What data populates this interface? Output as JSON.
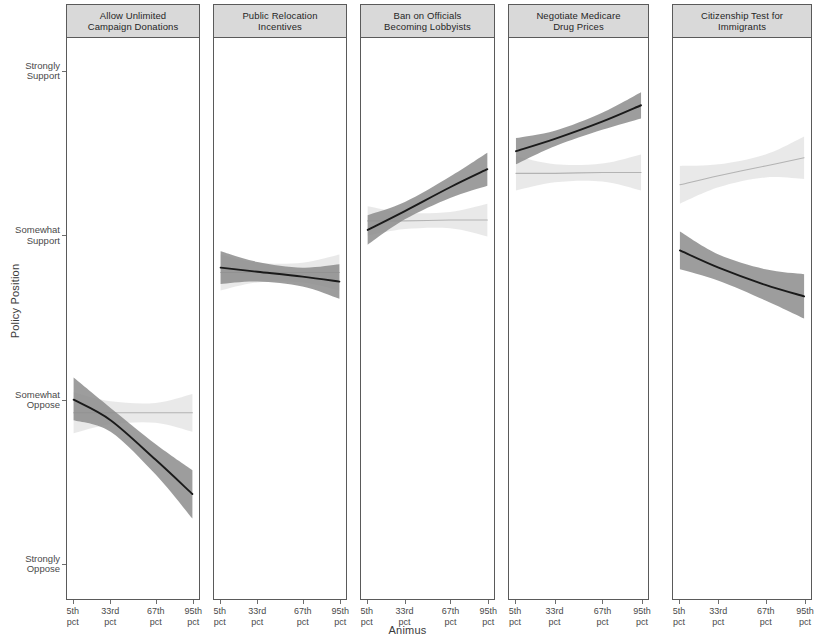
{
  "chart_data": {
    "type": "line",
    "title": "",
    "xlabel": "Animus",
    "ylabel": "Policy Position",
    "facet_titles": [
      "Allow Unlimited\nCampaign Donations",
      "Public Relocation\nIncentives",
      "Ban on Officials\nBecoming Lobbyists",
      "Negotiate Medicare\nDrug Prices",
      "Citizenship Test for\nImmigrants"
    ],
    "x_tick_labels": [
      "5th\npct",
      "33rd\npct",
      "67th\npct",
      "95th\npct"
    ],
    "x_tick_values": [
      5,
      33,
      67,
      95
    ],
    "y_tick_labels": [
      "Strongly\nSupport",
      "Somewhat\nSupport",
      "Somewhat\nOppose",
      "Strongly\nOppose"
    ],
    "y_tick_values": [
      4,
      3,
      2,
      1
    ],
    "ylim": [
      0.78,
      4.2
    ],
    "xlim": [
      0,
      100
    ],
    "grid": false,
    "legend": "none",
    "colors": {
      "series_dark_line": "#1a1a1a",
      "series_dark_band": "#8c8c8c",
      "series_light_line": "#b3b3b3",
      "series_light_band": "#e2e2e2",
      "panel_strip": "#d9d9d9",
      "panel_border": "#5a5a5a",
      "axis": "#6e6e6e"
    },
    "series": [
      {
        "name": "dark",
        "panels": [
          {
            "facet": "Allow Unlimited Campaign Donations",
            "x": [
              5,
              33,
              67,
              95
            ],
            "y": [
              1.995,
              1.87,
              1.63,
              1.42
            ],
            "ci_low": [
              1.87,
              1.8,
              1.54,
              1.27
            ],
            "ci_high": [
              2.13,
              1.945,
              1.725,
              1.565
            ]
          },
          {
            "facet": "Public Relocation Incentives",
            "x": [
              5,
              33,
              67,
              95
            ],
            "y": [
              2.8,
              2.775,
              2.745,
              2.715
            ],
            "ci_low": [
              2.7,
              2.715,
              2.685,
              2.61
            ],
            "ci_high": [
              2.9,
              2.835,
              2.8,
              2.82
            ]
          },
          {
            "facet": "Ban on Officials Becoming Lobbyists",
            "x": [
              5,
              33,
              67,
              95
            ],
            "y": [
              3.03,
              3.145,
              3.29,
              3.4
            ],
            "ci_low": [
              2.94,
              3.095,
              3.225,
              3.3
            ],
            "ci_high": [
              3.12,
              3.2,
              3.355,
              3.5
            ]
          },
          {
            "facet": "Negotiate Medicare Drug Prices",
            "x": [
              5,
              33,
              67,
              95
            ],
            "y": [
              3.51,
              3.585,
              3.69,
              3.79
            ],
            "ci_low": [
              3.43,
              3.54,
              3.64,
              3.71
            ],
            "ci_high": [
              3.59,
              3.635,
              3.745,
              3.87
            ]
          },
          {
            "facet": "Citizenship Test for Immigrants",
            "x": [
              5,
              33,
              67,
              95
            ],
            "y": [
              2.905,
              2.8,
              2.695,
              2.625
            ],
            "ci_low": [
              2.79,
              2.72,
              2.6,
              2.49
            ],
            "ci_high": [
              3.02,
              2.88,
              2.79,
              2.76
            ]
          }
        ]
      },
      {
        "name": "light",
        "panels": [
          {
            "facet": "Allow Unlimited Campaign Donations",
            "x": [
              5,
              33,
              67,
              95
            ],
            "y": [
              1.915,
              1.915,
              1.915,
              1.915
            ],
            "ci_low": [
              1.79,
              1.845,
              1.855,
              1.8
            ],
            "ci_high": [
              2.04,
              1.985,
              1.975,
              2.03
            ]
          },
          {
            "facet": "Public Relocation Incentives",
            "x": [
              5,
              33,
              67,
              95
            ],
            "y": [
              2.77,
              2.77,
              2.77,
              2.77
            ],
            "ci_low": [
              2.66,
              2.71,
              2.71,
              2.66
            ],
            "ci_high": [
              2.88,
              2.83,
              2.83,
              2.88
            ]
          },
          {
            "facet": "Ban on Officials Becoming Lobbyists",
            "x": [
              5,
              33,
              67,
              95
            ],
            "y": [
              3.085,
              3.085,
              3.09,
              3.09
            ],
            "ci_low": [
              2.995,
              3.035,
              3.04,
              2.99
            ],
            "ci_high": [
              3.175,
              3.135,
              3.14,
              3.19
            ]
          },
          {
            "facet": "Negotiate Medicare Drug Prices",
            "x": [
              5,
              33,
              67,
              95
            ],
            "y": [
              3.375,
              3.375,
              3.38,
              3.38
            ],
            "ci_low": [
              3.27,
              3.32,
              3.325,
              3.27
            ],
            "ci_high": [
              3.48,
              3.43,
              3.435,
              3.49
            ]
          },
          {
            "facet": "Citizenship Test for Immigrants",
            "x": [
              5,
              33,
              67,
              95
            ],
            "y": [
              3.305,
              3.36,
              3.42,
              3.47
            ],
            "ci_low": [
              3.19,
              3.29,
              3.35,
              3.34
            ],
            "ci_high": [
              3.42,
              3.43,
              3.49,
              3.6
            ]
          }
        ]
      }
    ]
  },
  "axis": {
    "y_title": "Policy Position",
    "x_title": "Animus",
    "y_ticks": [
      {
        "label": "Strongly\nSupport"
      },
      {
        "label": "Somewhat\nSupport"
      },
      {
        "label": "Somewhat\nOppose"
      },
      {
        "label": "Strongly\nOppose"
      }
    ],
    "x_ticks": [
      {
        "label": "5th\npct"
      },
      {
        "label": "33rd\npct"
      },
      {
        "label": "67th\npct"
      },
      {
        "label": "95th\npct"
      }
    ]
  },
  "panels": [
    {
      "title": "Allow Unlimited\nCampaign Donations"
    },
    {
      "title": "Public Relocation\nIncentives"
    },
    {
      "title": "Ban on Officials\nBecoming Lobbyists"
    },
    {
      "title": "Negotiate Medicare\nDrug Prices"
    },
    {
      "title": "Citizenship Test for\nImmigrants"
    }
  ]
}
